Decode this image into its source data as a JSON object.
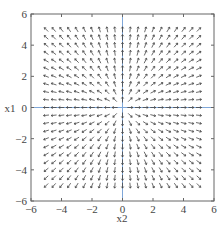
{
  "chart_data": {
    "type": "quiver",
    "title": "",
    "xlabel": "x2",
    "ylabel": "x1",
    "xlim": [
      -6,
      6
    ],
    "ylim": [
      -6,
      6
    ],
    "xticks": [
      -6,
      -4,
      -2,
      0,
      2,
      4,
      6
    ],
    "yticks": [
      -6,
      -4,
      -2,
      0,
      2,
      4,
      6
    ],
    "xtick_labels": [
      "−6",
      "−4",
      "−2",
      "0",
      "2",
      "4",
      "6"
    ],
    "ytick_labels": [
      "−6",
      "−4",
      "−2",
      "0",
      "2",
      "4",
      "6"
    ],
    "grid": false,
    "legend": null,
    "field": {
      "description": "Radial source field: vector at (x2, x1) points away from origin, arrows normalized to equal length",
      "u_expr": "x2",
      "v_expr": "x1",
      "grid_min": -5,
      "grid_max": 5,
      "grid_step": 0.5,
      "normalized": true
    },
    "reference_lines": [
      {
        "orientation": "horizontal",
        "value": 0,
        "color": "#7fa7d9"
      },
      {
        "orientation": "vertical",
        "value": 0,
        "color": "#7fa7d9"
      }
    ],
    "colors": {
      "arrow": "#444444",
      "axes": "#555555",
      "reference": "#7fa7d9"
    }
  },
  "labels": {
    "xlabel": "x2",
    "ylabel": "x1"
  }
}
